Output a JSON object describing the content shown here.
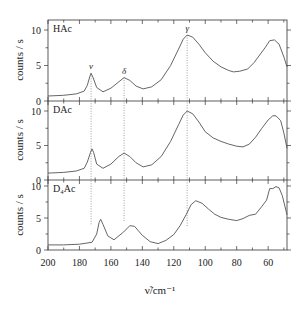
{
  "chart_data": {
    "type": "line",
    "title": "",
    "xlabel": "ν̃/cm⁻¹",
    "ylabel": "counts / s",
    "xlim": [
      200,
      48
    ],
    "xticks": [
      200,
      180,
      160,
      140,
      120,
      100,
      80,
      60
    ],
    "x_minor_step": 10,
    "grid": false,
    "legend": "none",
    "panels": [
      {
        "label": "HAc",
        "ylim": [
          0,
          11.3
        ],
        "yticks": [
          0,
          5,
          10
        ],
        "series": {
          "x": [
            200,
            190,
            182,
            177,
            175,
            173.5,
            172.6,
            171.5,
            169,
            165,
            160,
            155,
            151.6,
            148,
            144,
            139.5,
            134,
            128,
            122,
            117,
            114,
            111.5,
            108,
            104,
            100,
            95,
            90,
            85,
            82,
            78,
            73,
            69,
            65,
            62,
            59,
            56,
            53,
            50,
            48
          ],
          "y": [
            0.7,
            0.8,
            1.0,
            1.4,
            2.2,
            3.4,
            3.9,
            3.4,
            1.9,
            1.3,
            1.8,
            2.7,
            3.3,
            2.9,
            2.1,
            1.7,
            2.0,
            3.0,
            5.0,
            7.3,
            8.7,
            9.3,
            9.0,
            8.0,
            6.8,
            5.6,
            4.8,
            4.3,
            4.1,
            4.2,
            4.5,
            5.4,
            6.6,
            7.5,
            8.5,
            8.6,
            8.0,
            6.2,
            4.8
          ]
        }
      },
      {
        "label": "DAc",
        "ylim": [
          0,
          10.2
        ],
        "yticks": [
          0,
          5,
          10
        ],
        "series": {
          "x": [
            200,
            190,
            182,
            177,
            175,
            173,
            172,
            171,
            169,
            165,
            160,
            155,
            151.6,
            148,
            144,
            139.5,
            134,
            128,
            122,
            117,
            114,
            111.5,
            108,
            104,
            100,
            95,
            90,
            85,
            80,
            76,
            72,
            68,
            64,
            60,
            57,
            55,
            52,
            50,
            48
          ],
          "y": [
            1.0,
            1.1,
            1.3,
            1.7,
            2.6,
            4.0,
            4.5,
            4.0,
            2.3,
            1.7,
            2.3,
            3.4,
            3.9,
            3.4,
            2.5,
            1.9,
            2.2,
            3.4,
            5.6,
            8.0,
            9.4,
            10.0,
            9.6,
            8.4,
            7.0,
            6.1,
            5.6,
            5.2,
            4.9,
            4.8,
            5.2,
            6.2,
            7.5,
            8.7,
            9.3,
            9.3,
            8.6,
            6.8,
            4.6
          ]
        }
      },
      {
        "label": "D₄Ac",
        "ylim": [
          0,
          10.9
        ],
        "yticks": [
          0,
          5,
          10
        ],
        "series": {
          "x": [
            200,
            190,
            180,
            172,
            169,
            167.5,
            166.5,
            165,
            162,
            158,
            152,
            148,
            145,
            140,
            135,
            130,
            125,
            120,
            116,
            112,
            109,
            106,
            102,
            98,
            94,
            90,
            85,
            80,
            76,
            72,
            68,
            64,
            61,
            59,
            57,
            55,
            53,
            51,
            48
          ],
          "y": [
            0.8,
            0.8,
            0.9,
            1.2,
            2.5,
            4.3,
            4.8,
            4.0,
            2.2,
            1.6,
            2.8,
            3.8,
            3.7,
            2.3,
            1.3,
            1.0,
            1.5,
            2.4,
            3.8,
            5.6,
            7.1,
            7.7,
            7.3,
            6.4,
            5.6,
            5.1,
            4.8,
            4.6,
            4.9,
            5.4,
            5.6,
            6.8,
            7.8,
            9.6,
            9.6,
            9.9,
            9.7,
            8.5,
            5.5
          ]
        }
      }
    ],
    "annotations": [
      {
        "label": "ν",
        "x": 172.6,
        "panel": 0,
        "y": 3.9
      },
      {
        "label": "δ",
        "x": 151.6,
        "panel": 0,
        "y": 3.3
      },
      {
        "label": "γ",
        "x": 111.5,
        "panel": 0,
        "y": 9.3
      }
    ],
    "dotted_guides_x": [
      172.6,
      151.6,
      111.5
    ]
  }
}
